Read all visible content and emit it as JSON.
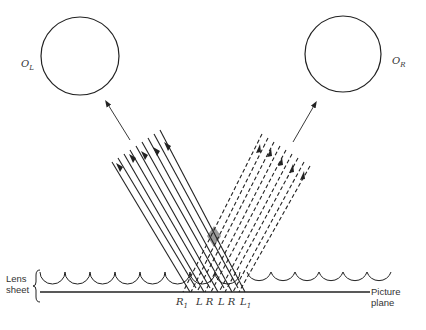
{
  "diagram": {
    "objects": [
      {
        "id": "left",
        "label": "O",
        "sub": "L"
      },
      {
        "id": "right",
        "label": "O",
        "sub": "R"
      }
    ],
    "lens_sheet_label": [
      "Lens",
      "sheet"
    ],
    "picture_plane_label": "Picture plane",
    "strip_labels": [
      {
        "text": "R",
        "sub": "1"
      },
      {
        "text": "L R",
        "sub": ""
      },
      {
        "text": "L R",
        "sub": ""
      },
      {
        "text": "L",
        "sub": "1"
      }
    ],
    "bundles": {
      "left_rays": "solid",
      "right_rays": "dashed"
    },
    "colors": {
      "stroke": "#222222",
      "overlap": "#999999"
    }
  }
}
